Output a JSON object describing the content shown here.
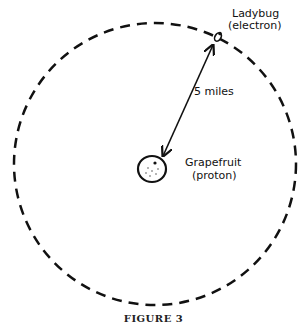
{
  "figure": {
    "caption": "FIGURE 3",
    "electron_label_line1": "Ladybug",
    "electron_label_line2": "(electron)",
    "proton_label_line1": "Grapefruit",
    "proton_label_line2": "(proton)",
    "distance_label": "5 miles"
  },
  "colors": {
    "ink": "#111111",
    "background": "#ffffff"
  }
}
